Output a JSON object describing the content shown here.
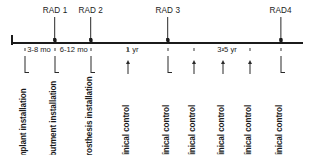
{
  "figure": {
    "axis_color": "#1b1b1b",
    "text_color": "#1b1b1b",
    "background": "#ffffff"
  },
  "chart_data": {
    "type": "timeline",
    "title": "",
    "xlabel": "",
    "ylabel": "",
    "orientation": "horizontal",
    "grid": false,
    "legend": false,
    "radiographs": [
      {
        "label": "RAD 1",
        "x_pct": 15.1
      },
      {
        "label": "RAD 2",
        "x_pct": 27.3
      },
      {
        "label": "RAD 3",
        "x_pct": 53.7
      },
      {
        "label": "RAD4",
        "x_pct": 92.3
      }
    ],
    "intervals": [
      {
        "label": "3-8 mo",
        "x_pct": 9.6
      },
      {
        "label": "6-12 mo",
        "x_pct": 21.5
      },
      {
        "label": "1 yr",
        "x_pct": 41.5
      },
      {
        "label": "3-5 yr",
        "x_pct": 74.0
      }
    ],
    "events": [
      {
        "label": "implant installation",
        "x_pct": 4.8,
        "marker": "hook"
      },
      {
        "label": "abutment installation",
        "x_pct": 15.1,
        "marker": "hook"
      },
      {
        "label": "prosthesis installation",
        "x_pct": 27.3,
        "marker": "hook"
      },
      {
        "label": "clinical control",
        "x_pct": 39.9,
        "marker": "arrow"
      },
      {
        "label": "clinical control",
        "x_pct": 53.7,
        "marker": "hook"
      },
      {
        "label": "clinical control",
        "x_pct": 62.7,
        "marker": "arrow"
      },
      {
        "label": "clinical control",
        "x_pct": 72.7,
        "marker": "arrow"
      },
      {
        "label": "clinical control",
        "x_pct": 82.0,
        "marker": "arrow"
      },
      {
        "label": "clinical control",
        "x_pct": 92.3,
        "marker": "hook"
      }
    ]
  }
}
